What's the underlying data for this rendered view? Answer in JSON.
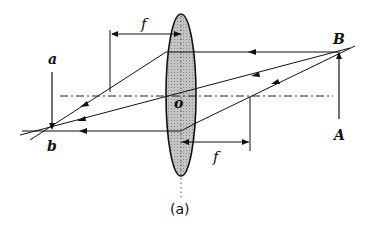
{
  "diagram": {
    "caption": "(a)",
    "labels": {
      "focal_left": "f",
      "focal_right": "f",
      "lens_center": "o",
      "object_top": "B",
      "object_base": "A",
      "image_top": "a",
      "image_tip": "b"
    },
    "colors": {
      "lens_fill": "#b8b8b8",
      "line": "#1a1a1a",
      "background": "#ffffff"
    }
  }
}
